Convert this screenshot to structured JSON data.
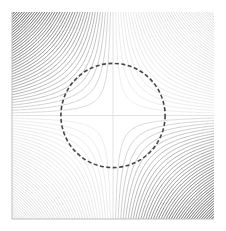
{
  "chart_data": {
    "type": "contour",
    "title": "",
    "xlabel": "",
    "ylabel": "",
    "function": "z = -x*y (saddle)",
    "xlim": [
      -1,
      1
    ],
    "ylim": [
      -1,
      1
    ],
    "grid": false,
    "legend": null,
    "contour_levels_count_per_sign": 40,
    "contour_level_max": 1.0,
    "colors": {
      "strong_quadrants": "#2a2a2a",
      "weak_quadrants": "#d8d8d8",
      "zero_line": "#dcdcdc",
      "axis": "#bfbfbf",
      "circle": "#444444"
    },
    "annotations": [
      {
        "type": "circle",
        "style": "dashed",
        "center": [
          0,
          0
        ],
        "radius": 0.51
      }
    ]
  },
  "plot": {
    "left": 12,
    "top": 12,
    "right": 214,
    "bottom": 219
  }
}
